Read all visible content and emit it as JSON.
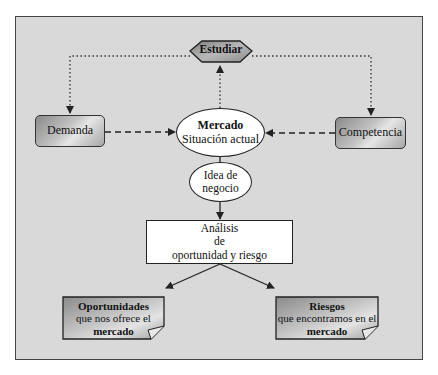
{
  "diagram": {
    "nodes": {
      "estudiar": {
        "label": "Estudiar",
        "shape": "hexagon"
      },
      "demanda": {
        "label": "Demanda",
        "shape": "rounded-rect"
      },
      "competencia": {
        "label": "Competencia",
        "shape": "rounded-rect"
      },
      "mercado": {
        "title": "Mercado",
        "subtitle": "Situación actual",
        "shape": "ellipse"
      },
      "idea": {
        "line1": "Idea de",
        "line2": "negocio",
        "shape": "ellipse"
      },
      "analisis": {
        "line1": "Análisis",
        "line2": "de",
        "line3": "oportunidad y riesgo",
        "shape": "rect"
      },
      "oportunidades": {
        "title": "Oportunidades",
        "line2": "que nos ofrece el",
        "line3": "mercado",
        "shape": "note"
      },
      "riesgos": {
        "title": "Riesgos",
        "line2": "que encontramos en el",
        "line3": "mercado",
        "shape": "note"
      }
    },
    "edges": [
      {
        "from": "estudiar",
        "to": "demanda",
        "style": "dotted"
      },
      {
        "from": "estudiar",
        "to": "competencia",
        "style": "dotted"
      },
      {
        "from": "mercado",
        "to": "estudiar",
        "style": "dotted"
      },
      {
        "from": "demanda",
        "to": "mercado",
        "style": "dashed"
      },
      {
        "from": "competencia",
        "to": "mercado",
        "style": "dashed"
      },
      {
        "from": "mercado",
        "to": "idea",
        "style": "solid"
      },
      {
        "from": "idea",
        "to": "analisis",
        "style": "solid"
      },
      {
        "from": "analisis",
        "to": "oportunidades",
        "style": "solid"
      },
      {
        "from": "analisis",
        "to": "riesgos",
        "style": "solid"
      }
    ],
    "colors": {
      "background": "#d9d9d9",
      "hexagon_fill": "#9a9a9a",
      "box_gradient_dark": "#8a8a8a",
      "box_gradient_light": "#e6e6e6",
      "white": "#ffffff",
      "stroke": "#222222"
    }
  }
}
